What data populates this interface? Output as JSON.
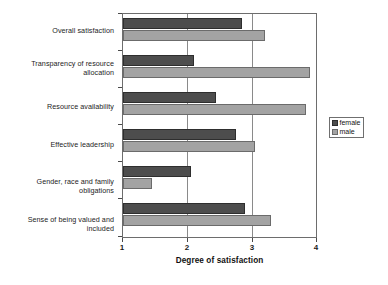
{
  "chart_data": {
    "type": "bar",
    "orientation": "horizontal",
    "title": "",
    "xlabel": "Degree of satisfaction",
    "ylabel": "",
    "xlim": [
      1,
      4
    ],
    "xticks": [
      "1",
      "2",
      "3",
      "4"
    ],
    "grid": true,
    "legend_position": "right",
    "categories": [
      "Overall satisfaction",
      "Transparency of resource allocation",
      "Resource availability",
      "Effective leadership",
      "Gender, race and family obligations",
      "Sense of being valued and included"
    ],
    "series": [
      {
        "name": "female",
        "color": "#4d4d4d",
        "values": [
          2.85,
          2.1,
          2.45,
          2.75,
          2.05,
          2.9
        ]
      },
      {
        "name": "male",
        "color": "#a3a3a3",
        "values": [
          3.2,
          3.9,
          3.85,
          3.05,
          1.45,
          3.3
        ]
      }
    ]
  },
  "legend": {
    "items": [
      {
        "label": "female",
        "swatch": "female"
      },
      {
        "label": "male",
        "swatch": "male"
      }
    ]
  }
}
